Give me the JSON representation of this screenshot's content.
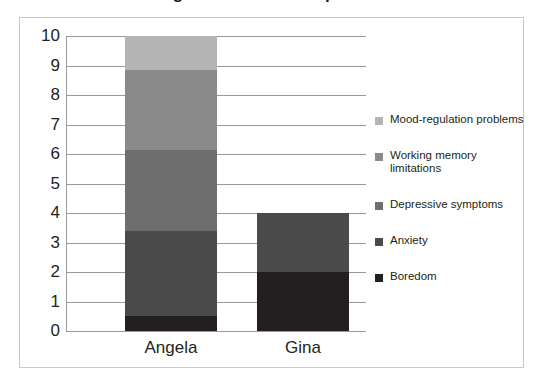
{
  "chart_data": {
    "type": "bar",
    "subtype": "stacked-bar",
    "title": "Figure: Stacked comparison",
    "categories": [
      "Angela",
      "Gina"
    ],
    "series": [
      {
        "name": "Boredom",
        "values": [
          0.5,
          2.0
        ],
        "color": "#231f20"
      },
      {
        "name": "Anxiety",
        "values": [
          2.9,
          2.0
        ],
        "color": "#4a4a4a"
      },
      {
        "name": "Depressive symptoms",
        "values": [
          2.75,
          0
        ],
        "color": "#6e6e6e"
      },
      {
        "name": "Working memory\nlimitations",
        "values": [
          2.7,
          0
        ],
        "color": "#8a8a8a"
      },
      {
        "name": "Mood-regulation problems",
        "values": [
          1.15,
          0
        ],
        "color": "#b4b4b4"
      }
    ],
    "totals": [
      10,
      4
    ],
    "xlabel": "",
    "ylabel": "",
    "ylim": [
      0,
      10
    ],
    "yticks": [
      "0",
      "1",
      "2",
      "3",
      "4",
      "5",
      "6",
      "7",
      "8",
      "9",
      "10"
    ],
    "grid": true,
    "legend_position": "right",
    "legend_entries": [
      "Mood-regulation problems",
      "Working memory\nlimitations",
      "Depressive symptoms",
      "Anxiety",
      "Boredom"
    ]
  },
  "colors": {
    "frame_border": "#c9c9c9",
    "gridline": "#9a9a9a",
    "axis": "#9a9a9a",
    "text": "#231f20",
    "background": "#ffffff"
  }
}
